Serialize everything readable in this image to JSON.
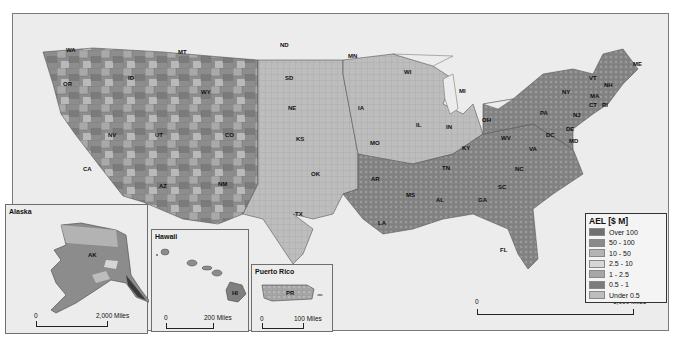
{
  "legend": {
    "title": "AEL [$ M]",
    "items": [
      {
        "label": "Over 100",
        "color": "#6f6f6f"
      },
      {
        "label": "50 - 100",
        "color": "#8a8a8a"
      },
      {
        "label": "10 - 50",
        "color": "#b4b4b4"
      },
      {
        "label": "2.5 - 10",
        "color": "#d6d6d6"
      },
      {
        "label": "1 - 2.5",
        "color": "#a6a6a6"
      },
      {
        "label": "0.5 - 1",
        "color": "#7c7c7c"
      },
      {
        "label": "Under 0.5",
        "color": "#bdbdbd"
      }
    ]
  },
  "main_map": {
    "scalebar": {
      "zero": "0",
      "label": "1,000 Miles"
    },
    "state_labels": [
      "WA",
      "OR",
      "CA",
      "ID",
      "NV",
      "MT",
      "WY",
      "UT",
      "AZ",
      "CO",
      "NM",
      "ND",
      "SD",
      "NE",
      "KS",
      "OK",
      "TX",
      "MN",
      "IA",
      "MO",
      "AR",
      "LA",
      "WI",
      "IL",
      "MI",
      "IN",
      "OH",
      "KY",
      "TN",
      "MS",
      "AL",
      "GA",
      "FL",
      "SC",
      "NC",
      "VA",
      "WV",
      "PA",
      "NY",
      "VT",
      "NH",
      "ME",
      "MA",
      "CT",
      "RI",
      "NJ",
      "DE",
      "MD",
      "DC"
    ]
  },
  "insets": {
    "alaska": {
      "title": "Alaska",
      "state_label": "AK",
      "scalebar": {
        "zero": "0",
        "label": "2,000 Miles"
      }
    },
    "hawaii": {
      "title": "Hawaii",
      "state_label": "HI",
      "scalebar": {
        "zero": "0",
        "label": "200 Miles"
      }
    },
    "puerto_rico": {
      "title": "Puerto Rico",
      "state_label": "PR",
      "scalebar": {
        "zero": "0",
        "label": "100 Miles"
      }
    }
  }
}
